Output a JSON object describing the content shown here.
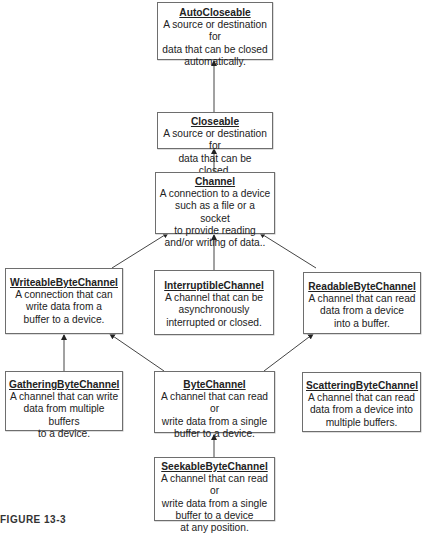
{
  "nodes": {
    "autocloseable": {
      "title": "AutoCloseable",
      "desc": "A source or destination for\ndata that can be closed\nautomatically."
    },
    "closeable": {
      "title": "Closeable",
      "desc": "A source or destination for\ndata that can be closed."
    },
    "channel": {
      "title": "Channel",
      "desc": "A connection to a device\nsuch as a file or a socket\nto provide reading\nand/or writing of data.."
    },
    "writeable": {
      "title": "WriteableByteChannel",
      "desc": "A connection that can\nwrite data from a\nbuffer to a device."
    },
    "interruptible": {
      "title": "InterruptibleChannel",
      "desc": "A channel that can be\nasynchronously\ninterrupted or closed."
    },
    "readable": {
      "title": "ReadableByteChannel",
      "desc": "A channel that can read\ndata from a device\ninto a buffer."
    },
    "gathering": {
      "title": "GatheringByteChannel",
      "desc": "A channel that can write\ndata from multiple buffers\nto a device."
    },
    "bytechannel": {
      "title": "ByteChannel",
      "desc": "A channel that can read or\nwrite data from a single\nbuffer to a device."
    },
    "scattering": {
      "title": "ScatteringByteChannel",
      "desc": "A channel that can read\ndata from a device into\nmultiple buffers."
    },
    "seekable": {
      "title": "SeekableByteChannel",
      "desc": "A channel that can read or\nwrite data from a single\nbuffer to a device\nat any position."
    }
  },
  "edges": [
    {
      "from": "Closeable",
      "to": "AutoCloseable"
    },
    {
      "from": "Channel",
      "to": "Closeable"
    },
    {
      "from": "WriteableByteChannel",
      "to": "Channel"
    },
    {
      "from": "InterruptibleChannel",
      "to": "Channel"
    },
    {
      "from": "ReadableByteChannel",
      "to": "Channel"
    },
    {
      "from": "GatheringByteChannel",
      "to": "WriteableByteChannel"
    },
    {
      "from": "ByteChannel",
      "to": "WriteableByteChannel"
    },
    {
      "from": "ByteChannel",
      "to": "ReadableByteChannel"
    },
    {
      "from": "SeekableByteChannel",
      "to": "ByteChannel"
    }
  ],
  "caption": "FIGURE 13-3"
}
